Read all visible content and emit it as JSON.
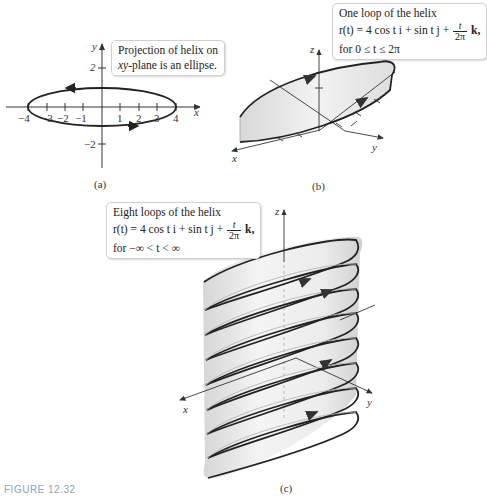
{
  "figure": {
    "caption": "FIGURE 12.32"
  },
  "panel_a": {
    "label": "(a)",
    "callout": {
      "line1": "Projection of helix on",
      "line2_var": "xy",
      "line2_rest": "-plane is an ellipse."
    },
    "axes": {
      "x_label": "x",
      "y_label": "y"
    },
    "x_ticks": [
      "−4",
      "−3",
      "−2",
      "−1",
      "1",
      "2",
      "3",
      "4"
    ],
    "y_ticks": [
      "2",
      "−2"
    ]
  },
  "panel_b": {
    "label": "(b)",
    "callout": {
      "line1": "One loop of the helix",
      "eq_lhs": "r(t) = 4 cos t i + sin t j + ",
      "frac_num": "t",
      "frac_den": "2π",
      "eq_tail": " k,",
      "line3": "for 0 ≤ t ≤ 2π"
    },
    "axes": {
      "x_label": "x",
      "y_label": "y",
      "z_label": "z"
    }
  },
  "panel_c": {
    "label": "(c)",
    "callout": {
      "line1": "Eight loops of the helix",
      "eq_lhs": "r(t) = 4 cos t i + sin t j + ",
      "frac_num": "t",
      "frac_den": "2π",
      "eq_tail": " k,",
      "line3": "for −∞ < t < ∞"
    },
    "axes": {
      "x_label": "x",
      "y_label": "y",
      "z_label": "z"
    },
    "loops": 8
  },
  "colors": {
    "curve": "#222222",
    "surface": "#e9e9e9",
    "axis": "#333333",
    "caption": "#8aa4b8"
  }
}
